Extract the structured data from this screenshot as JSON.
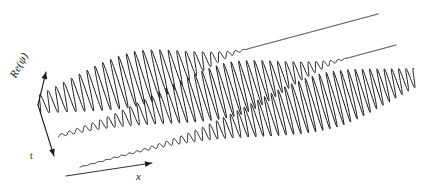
{
  "figure": {
    "title": "",
    "background_color": "#ffffff",
    "line_color": "#1a1a1a",
    "width": 421,
    "height": 193
  },
  "axes": {
    "vertical": {
      "label": "Re(ψ)",
      "name": "re-psi-axis",
      "origin": [
        38,
        105
      ],
      "tip": [
        46,
        72
      ]
    },
    "horizontal": {
      "label": "x",
      "name": "x-axis",
      "start": [
        66,
        176
      ],
      "tip": [
        152,
        163
      ]
    },
    "depth": {
      "label": "t",
      "name": "t-axis",
      "origin": [
        38,
        105
      ],
      "tip": [
        54,
        156
      ]
    }
  },
  "chart_data": {
    "type": "line",
    "xlabel": "x",
    "ylabel": "Re(ψ)",
    "zlabel": "t",
    "legend": [],
    "grid": false,
    "series": [
      {
        "name": "t1",
        "label": "earliest time",
        "baseline_start": [
          38,
          105
        ],
        "baseline_end": [
          378,
          14
        ],
        "envelope_center_frac": 0.3,
        "envelope_width_frac": 0.2,
        "amplitude": 27,
        "cycles": 40,
        "phase": 0.0,
        "chirp": 0.18,
        "tail_fade_frac": 0.62
      },
      {
        "name": "t2",
        "label": "middle time",
        "baseline_start": [
          58,
          136
        ],
        "baseline_end": [
          396,
          45
        ],
        "envelope_center_frac": 0.52,
        "envelope_width_frac": 0.21,
        "amplitude": 27,
        "cycles": 42,
        "phase": 0.4,
        "chirp": 0.18,
        "tail_fade_frac": 0.86
      },
      {
        "name": "t3",
        "label": "latest time",
        "baseline_start": [
          80,
          167
        ],
        "baseline_end": [
          416,
          77
        ],
        "envelope_center_frac": 0.74,
        "envelope_width_frac": 0.22,
        "amplitude": 28,
        "cycles": 43,
        "phase": 0.8,
        "chirp": 0.16,
        "tail_fade_frac": 1.3
      }
    ],
    "axis_ranges": {
      "x": "arbitrary units, increasing to the right",
      "y": "arbitrary units",
      "t": "three discrete snapshots, increasing toward the lower left"
    }
  }
}
